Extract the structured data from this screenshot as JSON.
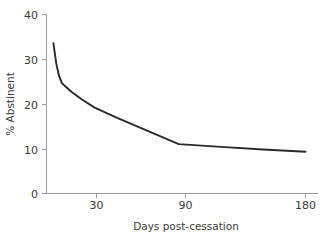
{
  "chart_data": {
    "type": "line",
    "title": "",
    "xlabel": "Days post-cessation",
    "ylabel": "% Abstinent",
    "xlim": [
      0,
      185
    ],
    "ylim": [
      0,
      40
    ],
    "grid": false,
    "legend": false,
    "xticks": [
      30,
      90,
      180
    ],
    "xtick_labels": [
      "30",
      "90",
      "180"
    ],
    "yticks": [
      0,
      10,
      20,
      30,
      40
    ],
    "ytick_labels": [
      "0",
      "10",
      "20",
      "30",
      "40"
    ],
    "series": [
      {
        "name": "% Abstinent",
        "color": "#2a2a2a",
        "x": [
          1,
          3,
          5,
          7,
          9,
          14,
          21,
          30,
          45,
          60,
          75,
          90,
          120,
          150,
          180
        ],
        "y": [
          33.5,
          29.0,
          26.2,
          24.6,
          24.0,
          22.6,
          21.0,
          19.2,
          17.0,
          15.0,
          13.0,
          11.0,
          10.4,
          9.8,
          9.3
        ]
      }
    ]
  },
  "axes": {
    "y_title": "% Abstinent",
    "x_title": "Days post-cessation",
    "y_labels": [
      "40",
      "30",
      "20",
      "10",
      "0"
    ],
    "x_labels": [
      "30",
      "90",
      "180"
    ]
  }
}
